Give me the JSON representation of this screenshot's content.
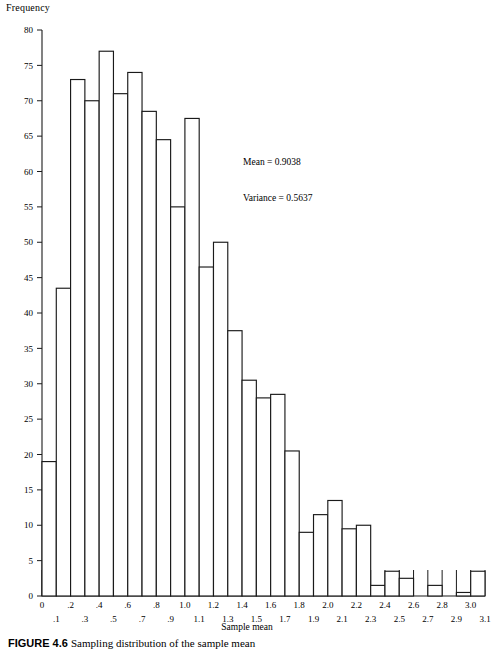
{
  "figure": {
    "caption_label": "FIGURE 4.6",
    "caption_text": "Sampling distribution of the sample mean"
  },
  "annotation": {
    "mean_line": "Mean = 0.9038",
    "variance_line": "Variance = 0.5637"
  },
  "chart_data": {
    "type": "bar",
    "title": "",
    "subtitle": "",
    "xlabel": "Sample mean",
    "ylabel": "Frequency",
    "grid": false,
    "legend": null,
    "bin_width": 0.1,
    "xlim": [
      0,
      3.1
    ],
    "ylim": [
      0,
      80
    ],
    "ytick_step": 5,
    "ytick_labels": [
      "0",
      "5",
      "10",
      "15",
      "20",
      "25",
      "30",
      "35",
      "40",
      "45",
      "50",
      "55",
      "60",
      "65",
      "70",
      "75",
      "80"
    ],
    "xtick_labels": [
      "0",
      ".1",
      ".2",
      ".3",
      ".4",
      ".5",
      ".6",
      ".7",
      ".8",
      ".9",
      "1.0",
      "1.1",
      "1.2",
      "1.3",
      "1.4",
      "1.5",
      "1.6",
      "1.7",
      "1.8",
      "1.9",
      "2.0",
      "2.1",
      "2.2",
      "2.3",
      "2.4",
      "2.5",
      "2.6",
      "2.7",
      "2.8",
      "2.9",
      "3.0",
      "3.1"
    ],
    "bin_starts": [
      0,
      0.1,
      0.2,
      0.3,
      0.4,
      0.5,
      0.6,
      0.7,
      0.8,
      0.9,
      1.0,
      1.1,
      1.2,
      1.3,
      1.4,
      1.5,
      1.6,
      1.7,
      1.8,
      1.9,
      2.0,
      2.1,
      2.2,
      2.3,
      2.4,
      2.5,
      2.6,
      2.7,
      2.8,
      2.9,
      3.0
    ],
    "categories": [
      "0-.1",
      ".1-.2",
      ".2-.3",
      ".3-.4",
      ".4-.5",
      ".5-.6",
      ".6-.7",
      ".7-.8",
      ".8-.9",
      ".9-1.0",
      "1.0-1.1",
      "1.1-1.2",
      "1.2-1.3",
      "1.3-1.4",
      "1.4-1.5",
      "1.5-1.6",
      "1.6-1.7",
      "1.7-1.8",
      "1.8-1.9",
      "1.9-2.0",
      "2.0-2.1",
      "2.1-2.2",
      "2.2-2.3",
      "2.3-2.4",
      "2.4-2.5",
      "2.5-2.6",
      "2.6-2.7",
      "2.7-2.8",
      "2.8-2.9",
      "2.9-3.0",
      "3.0-3.1"
    ],
    "values": [
      19,
      43.5,
      73,
      70,
      77,
      71,
      74,
      68.5,
      64.5,
      55,
      67.5,
      46.5,
      50,
      37.5,
      30.5,
      28,
      28.5,
      20.5,
      9,
      11.5,
      13.5,
      9.5,
      10,
      1.5,
      3.5,
      2.5,
      0,
      1.5,
      0,
      0.5,
      3.5
    ]
  }
}
